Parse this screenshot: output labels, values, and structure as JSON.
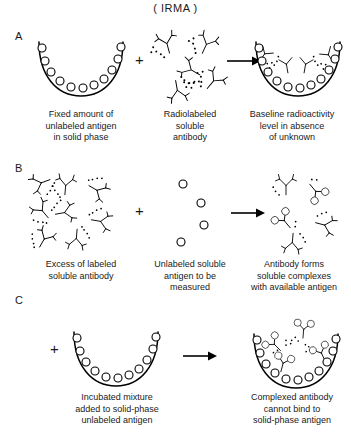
{
  "figure": {
    "title": "( IRMA )",
    "assay_name": "IRMA",
    "panels": [
      {
        "letter": "A",
        "steps": [
          {
            "icon": "coated-well",
            "caption": "Fixed amount of\nunlabeled antigen\nin solid phase",
            "antigen_count": 11,
            "antibody_count": 0
          },
          {
            "icon": "labeled-antibodies",
            "caption": "Radiolabeled\nsoluble\nantibody",
            "antigen_count": 0,
            "antibody_count": 5
          },
          {
            "icon": "well-with-bound-antibody",
            "caption": "Baseline radioactivity\nlevel in absence\nof unknown",
            "antigen_count": 11,
            "antibody_count": 5
          }
        ],
        "operators": [
          "+",
          "→"
        ]
      },
      {
        "letter": "B",
        "steps": [
          {
            "icon": "labeled-antibodies",
            "caption": "Excess of labeled\nsoluble antibody",
            "antigen_count": 0,
            "antibody_count": 8
          },
          {
            "icon": "free-antigens",
            "caption": "Unlabeled soluble\nantigen to be\nmeasured",
            "antigen_count": 4,
            "antibody_count": 0
          },
          {
            "icon": "soluble-complexes",
            "caption": "Antibody forms\nsoluble complexes\nwith available antigen",
            "antigen_count": 4,
            "antibody_count": 5
          }
        ],
        "operators": [
          "+",
          "→"
        ]
      },
      {
        "letter": "C",
        "steps": [
          {
            "icon": "coated-well",
            "caption": "Incubated mixture\nadded to solid-phase\nunlabeled antigen",
            "antigen_count": 11,
            "antibody_count": 0
          },
          {
            "icon": "well-with-unbound-complexes",
            "caption": "Complexed antibody\ncannot bind to\nsolid-phase antigen",
            "antigen_count": 11,
            "antibody_count": 4
          }
        ],
        "operators": [
          "+",
          "→"
        ]
      }
    ],
    "colors": {
      "ink": "#000000",
      "background": "#ffffff",
      "antigen_fill": "#ffffff"
    }
  }
}
